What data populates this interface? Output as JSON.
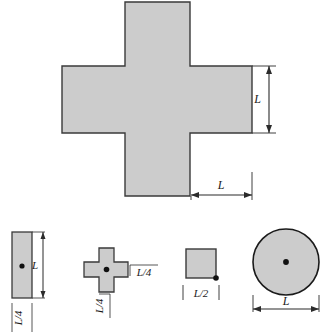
{
  "figure": {
    "fill_color": "#cccccc",
    "stroke_color": "#2b2b2b",
    "background": "#ffffff"
  },
  "main_shape": {
    "name": "plus-cross",
    "dim_vertical_label": "L",
    "dim_horizontal_label": "L"
  },
  "small_shapes": [
    {
      "name": "narrow-rectangle",
      "dim_height_label": "L",
      "dim_width_label": "L/4",
      "has_centroid_dot": true
    },
    {
      "name": "small-cross",
      "dim_arm_width_label": "L/4",
      "dim_arm_thickness_label": "L/4",
      "has_centroid_dot": true
    },
    {
      "name": "square",
      "dim_side_label": "L/2",
      "has_corner_dot": true
    },
    {
      "name": "circle",
      "dim_diameter_label": "L",
      "has_centroid_dot": true
    }
  ]
}
